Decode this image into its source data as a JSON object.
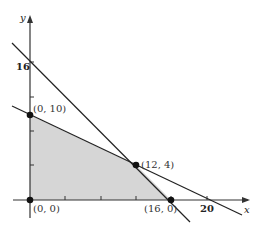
{
  "diagram": {
    "type": "linear-programming-feasible-region",
    "axes": {
      "x_label": "x",
      "y_label": "y",
      "x_tick_label": "20",
      "y_tick_label": "16"
    },
    "vertices": [
      {
        "label": "(0, 0)",
        "x": 0,
        "y": 0
      },
      {
        "label": "(0, 10)",
        "x": 0,
        "y": 10
      },
      {
        "label": "(12, 4)",
        "x": 12,
        "y": 4
      },
      {
        "label": "(16, 0)",
        "x": 16,
        "y": 0
      }
    ],
    "lines": [
      {
        "name": "line-through-0-16-and-16-0-steep",
        "from": [
          0,
          16
        ],
        "to": [
          16,
          0
        ]
      },
      {
        "name": "line-through-0-10-and-20-0",
        "from": [
          0,
          10
        ],
        "to": [
          20,
          0
        ]
      }
    ],
    "shaded_region_color": "#d3d3d3",
    "line_color": "#222222"
  }
}
